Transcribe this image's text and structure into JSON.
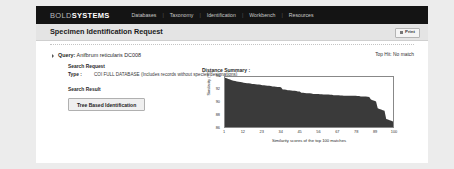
{
  "nav": {
    "logo_bold": "BOLD",
    "logo_systems": "SYSTEMS",
    "separator": "|",
    "items": [
      {
        "label": "Databases"
      },
      {
        "label": "Taxonomy"
      },
      {
        "label": "Identification"
      },
      {
        "label": "Workbench"
      },
      {
        "label": "Resources"
      }
    ]
  },
  "header": {
    "page_title": "Specimen Identification Request",
    "print_label": "Print",
    "print_icon": "printer-icon"
  },
  "panel": {
    "query_label": "Query:",
    "query_value": "Anifbrum reticularis DC008",
    "top_hit": "Top Hit: No match",
    "search_request": {
      "label": "Search Request",
      "type_key": "Type :",
      "type_value": "COI FULL DATABASE (Includes records without species designations)"
    },
    "search_result": {
      "label": "Search Result",
      "tree_button": "Tree Based Identification"
    }
  },
  "chart_data": {
    "type": "area",
    "title": "Distance Summary :",
    "xlabel": "Similarity scores of the top 100 matches",
    "ylabel": "Similarity (%)",
    "xlim": [
      1,
      100
    ],
    "ylim": [
      86,
      94
    ],
    "xticks": [
      1,
      12,
      23,
      34,
      45,
      56,
      67,
      78,
      89,
      100
    ],
    "yticks": [
      86,
      88,
      90,
      92,
      94
    ],
    "grid": false,
    "legend": null,
    "fill_color": "#3a3a3a",
    "x": [
      1,
      2,
      3,
      4,
      5,
      6,
      7,
      8,
      9,
      10,
      11,
      12,
      13,
      14,
      15,
      16,
      17,
      18,
      19,
      20,
      21,
      22,
      23,
      24,
      25,
      26,
      27,
      28,
      29,
      30,
      31,
      32,
      33,
      34,
      35,
      36,
      37,
      38,
      39,
      40,
      41,
      42,
      43,
      44,
      45,
      46,
      47,
      48,
      49,
      50,
      51,
      52,
      53,
      54,
      55,
      56,
      57,
      58,
      59,
      60,
      61,
      62,
      63,
      64,
      65,
      66,
      67,
      68,
      69,
      70,
      71,
      72,
      73,
      74,
      75,
      76,
      77,
      78,
      79,
      80,
      81,
      82,
      83,
      84,
      85,
      86,
      87,
      88,
      89,
      90,
      91,
      92,
      93,
      94,
      95,
      96,
      97,
      98,
      99,
      100
    ],
    "values": [
      93.9,
      93.8,
      93.7,
      93.6,
      93.5,
      93.4,
      93.35,
      93.3,
      93.25,
      93.2,
      93.15,
      93.1,
      93.05,
      93.0,
      93.0,
      92.95,
      92.9,
      92.9,
      92.85,
      92.8,
      92.8,
      92.75,
      92.7,
      92.7,
      92.65,
      92.6,
      92.6,
      92.55,
      92.5,
      92.5,
      92.45,
      92.4,
      92.4,
      92.35,
      92.0,
      92.0,
      91.95,
      91.9,
      91.9,
      91.85,
      91.8,
      91.8,
      91.75,
      91.7,
      91.7,
      91.5,
      91.5,
      91.45,
      91.4,
      91.4,
      91.4,
      91.35,
      91.3,
      91.3,
      91.3,
      91.3,
      91.25,
      91.25,
      91.2,
      91.2,
      91.2,
      91.2,
      91.15,
      91.15,
      91.1,
      91.1,
      91.1,
      91.1,
      91.05,
      91.05,
      91.0,
      91.0,
      91.0,
      91.0,
      91.0,
      91.0,
      91.0,
      91.0,
      90.95,
      90.95,
      90.9,
      90.9,
      90.9,
      90.9,
      90.85,
      90.8,
      90.4,
      90.3,
      90.2,
      90.1,
      89.0,
      88.9,
      88.8,
      88.7,
      88.6,
      87.3,
      87.2,
      87.1,
      87.0,
      86.9
    ]
  }
}
